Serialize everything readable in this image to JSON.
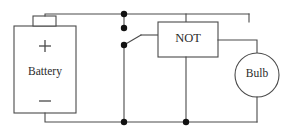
{
  "diagram": {
    "type": "electrical-schematic",
    "wire_color": "#4a4a4a",
    "node_color": "#111111",
    "background": "#ffffff",
    "components": {
      "battery": {
        "label": "Battery",
        "positive_terminal": "+",
        "negative_terminal": "−"
      },
      "logic_gate": {
        "label": "NOT"
      },
      "lamp": {
        "label": "Bulb"
      },
      "switch": {
        "state": "open"
      }
    },
    "junction_dots": [
      {
        "x": 124,
        "y": 14
      },
      {
        "x": 124,
        "y": 28
      },
      {
        "x": 124,
        "y": 45
      },
      {
        "x": 124,
        "y": 122
      },
      {
        "x": 186,
        "y": 122
      }
    ]
  }
}
